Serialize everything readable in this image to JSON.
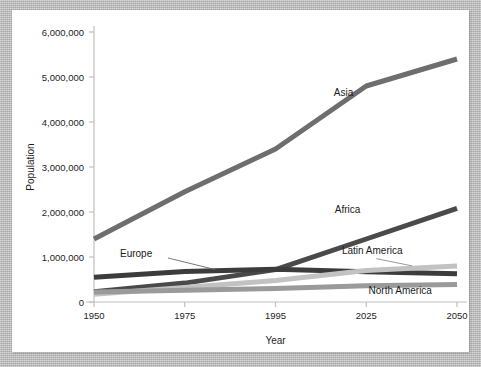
{
  "chart_data": {
    "type": "line",
    "title": "",
    "xlabel": "Year",
    "ylabel": "Population",
    "categories": [
      "1950",
      "1975",
      "1995",
      "2025",
      "2050"
    ],
    "x_tick_labels": [
      "1950",
      "1975",
      "1995",
      "2025",
      "2050"
    ],
    "y_tick_labels": [
      "0",
      "1,000,000",
      "2,000,000",
      "3,000,000",
      "4,000,000",
      "5,000,000",
      "6,000,000"
    ],
    "y_ticks": [
      0,
      1000000,
      2000000,
      3000000,
      4000000,
      5000000,
      6000000
    ],
    "ylim": [
      0,
      6000000
    ],
    "grid": false,
    "legend": "inline-annotations",
    "series": [
      {
        "name": "Asia",
        "label": "Asia",
        "color": "#6e6e6e",
        "values": [
          1400000,
          2450000,
          3400000,
          4800000,
          5400000
        ],
        "label_x": 1995,
        "label_value": 4350000
      },
      {
        "name": "Africa",
        "label": "Africa",
        "color": "#4a4a4a",
        "values": [
          230000,
          420000,
          720000,
          1400000,
          2080000
        ],
        "label_x": 1995,
        "label_value": 1800000
      },
      {
        "name": "Europe",
        "label": "Europe",
        "color": "#3c3c3c",
        "values": [
          550000,
          680000,
          730000,
          670000,
          630000
        ],
        "label_x": 1950,
        "label_value": 1000000,
        "leader_line": true
      },
      {
        "name": "Latin America",
        "label": "Latin America",
        "color": "#c2c2c2",
        "values": [
          170000,
          320000,
          480000,
          700000,
          800000
        ],
        "label_x": 2025,
        "label_value": 1030000,
        "leader_line": true
      },
      {
        "name": "North America",
        "label": "North America",
        "color": "#9a9a9a",
        "values": [
          220000,
          260000,
          300000,
          360000,
          390000
        ],
        "label_x": 2025,
        "label_value": 170000
      }
    ]
  },
  "axes": {
    "y_axis_title": "Population",
    "x_axis_title": "Year"
  },
  "colors": {
    "background_mat": "#b5b5b5",
    "card": "#ffffff",
    "axis": "#bdbdbd",
    "text": "#1d1d1d"
  }
}
